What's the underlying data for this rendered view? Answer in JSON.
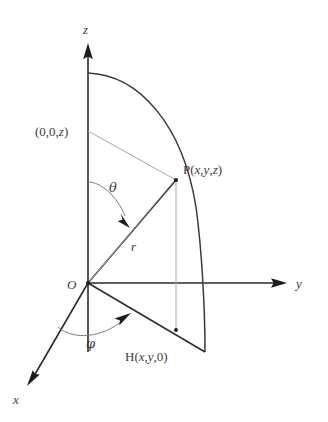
{
  "figure": {
    "background_color": "#ffffff",
    "stroke_color": "#2b2b2b",
    "light_stroke_color": "#a8a8a8"
  },
  "axes": [
    {
      "name": "z",
      "label": "z",
      "label_x": 85,
      "label_y": 33,
      "direction": "up"
    },
    {
      "name": "y",
      "label": "y",
      "label_x": 297,
      "label_y": 288,
      "direction": "right"
    },
    {
      "name": "x",
      "label": "x",
      "label_x": 14,
      "label_y": 403,
      "direction": "down-left"
    }
  ],
  "points": [
    {
      "name": "origin",
      "label": "O",
      "label_x": 69,
      "label_y": 288,
      "px": 88,
      "py": 283
    },
    {
      "name": "point-p",
      "label": "P(",
      "label_x": 184,
      "label_y": 173,
      "px": 176,
      "py": 180
    },
    {
      "name": "point-h",
      "label": "H(",
      "label_x": 126,
      "label_y": 360,
      "px": 176,
      "py": 330
    },
    {
      "name": "point-z-axis",
      "label": "(0,0,",
      "label_x": 36,
      "label_y": 135,
      "px": 88,
      "py": 131
    }
  ],
  "labels": {
    "z_axis": "z",
    "y_axis": "y",
    "x_axis": "x",
    "origin": "O",
    "point_p": "P(x,y,z)",
    "point_p_prefix": "P(",
    "point_p_x": "x",
    "point_p_comma1": ",",
    "point_p_y": "y",
    "point_p_comma2": ",",
    "point_p_z": "z",
    "point_p_suffix": ")",
    "point_h": "H(x,y,0)",
    "point_h_prefix": "H(",
    "point_h_x": "x",
    "point_h_y": "y",
    "point_h_zero": "0",
    "point_h_suffix": ")",
    "z_intercept": "(0,0,z)",
    "z_intercept_prefix": "(0,0,",
    "z_intercept_z": "z",
    "z_intercept_suffix": ")",
    "theta": "θ",
    "phi": "φ",
    "radius": "r"
  },
  "geometry": {
    "origin": {
      "x": 88,
      "y": 283
    },
    "z_axis_tip": {
      "x": 88,
      "y": 45
    },
    "y_axis_tip": {
      "x": 286,
      "y": 283
    },
    "x_axis_tip": {
      "x": 27,
      "y": 384
    },
    "p": {
      "x": 176,
      "y": 180
    },
    "h": {
      "x": 176,
      "y": 330
    },
    "z_point": {
      "x": 88,
      "y": 131
    },
    "arc_top": {
      "x": 88,
      "y": 73
    },
    "arc_bottom": {
      "x": 205,
      "y": 352
    },
    "theta_arc_start": {
      "x": 88,
      "y": 182
    },
    "theta_arc_end": {
      "x": 128,
      "y": 222
    },
    "phi_arc_start": {
      "x": 58,
      "y": 328
    },
    "phi_arc_end": {
      "x": 127,
      "y": 318
    },
    "theta_label": {
      "x": 110,
      "y": 191
    },
    "phi_label": {
      "x": 88,
      "y": 346
    },
    "r_label": {
      "x": 132,
      "y": 250
    }
  }
}
